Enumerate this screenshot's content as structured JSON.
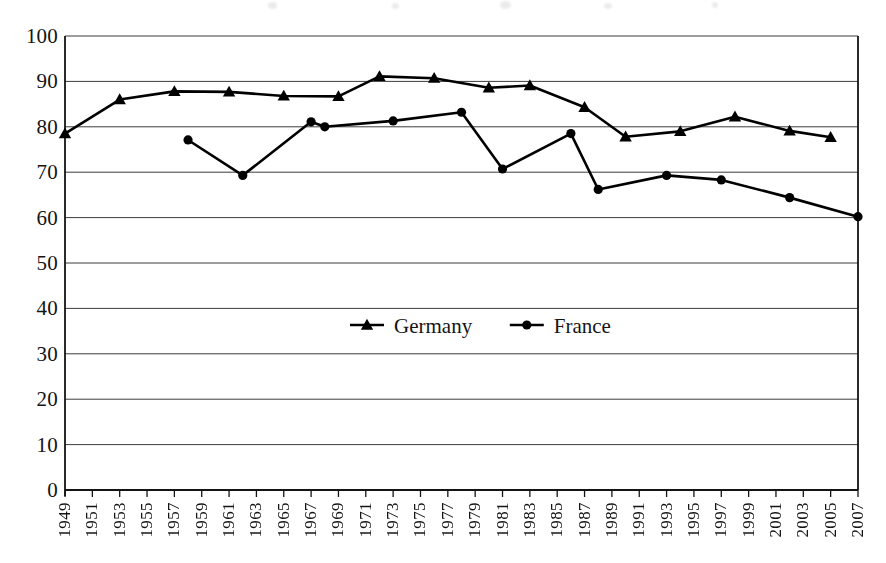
{
  "chart_data": {
    "type": "line",
    "title": "",
    "subtitle": "",
    "xlabel": "",
    "ylabel": "",
    "ylim": [
      0,
      100
    ],
    "ytick_step": 10,
    "yticks": [
      "0",
      "10",
      "20",
      "30",
      "40",
      "50",
      "60",
      "70",
      "80",
      "90",
      "100"
    ],
    "xlim": [
      1949,
      2007
    ],
    "xtick_step": 2,
    "xticks": [
      "1949",
      "1951",
      "1953",
      "1955",
      "1957",
      "1959",
      "1961",
      "1963",
      "1965",
      "1967",
      "1969",
      "1971",
      "1973",
      "1975",
      "1977",
      "1979",
      "1981",
      "1983",
      "1985",
      "1987",
      "1989",
      "1991",
      "1993",
      "1995",
      "1997",
      "1999",
      "2001",
      "2003",
      "2005",
      "2007"
    ],
    "grid": "horizontal",
    "legend_position": "center",
    "series": [
      {
        "name": "Germany",
        "marker": "triangle",
        "color": "#000000",
        "points": [
          {
            "x": 1949,
            "y": 78.5
          },
          {
            "x": 1953,
            "y": 86.0
          },
          {
            "x": 1957,
            "y": 87.8
          },
          {
            "x": 1961,
            "y": 87.7
          },
          {
            "x": 1965,
            "y": 86.8
          },
          {
            "x": 1969,
            "y": 86.7
          },
          {
            "x": 1972,
            "y": 91.1
          },
          {
            "x": 1976,
            "y": 90.7
          },
          {
            "x": 1980,
            "y": 88.6
          },
          {
            "x": 1983,
            "y": 89.1
          },
          {
            "x": 1987,
            "y": 84.3
          },
          {
            "x": 1990,
            "y": 77.8
          },
          {
            "x": 1994,
            "y": 79.0
          },
          {
            "x": 1998,
            "y": 82.2
          },
          {
            "x": 2002,
            "y": 79.1
          },
          {
            "x": 2005,
            "y": 77.7
          }
        ]
      },
      {
        "name": "France",
        "marker": "circle",
        "color": "#000000",
        "points": [
          {
            "x": 1958,
            "y": 77.1
          },
          {
            "x": 1962,
            "y": 69.3
          },
          {
            "x": 1967,
            "y": 81.1
          },
          {
            "x": 1968,
            "y": 80.0
          },
          {
            "x": 1973,
            "y": 81.3
          },
          {
            "x": 1978,
            "y": 83.2
          },
          {
            "x": 1981,
            "y": 70.7
          },
          {
            "x": 1986,
            "y": 78.5
          },
          {
            "x": 1988,
            "y": 66.2
          },
          {
            "x": 1993,
            "y": 69.3
          },
          {
            "x": 1997,
            "y": 68.3
          },
          {
            "x": 2002,
            "y": 64.4
          },
          {
            "x": 2007,
            "y": 60.2
          }
        ]
      }
    ]
  },
  "legend": {
    "items": [
      {
        "label": "Germany",
        "marker": "triangle"
      },
      {
        "label": "France",
        "marker": "circle"
      }
    ]
  }
}
